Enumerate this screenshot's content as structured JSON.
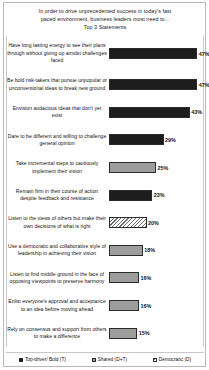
{
  "chart_data": {
    "type": "bar",
    "title": "In order to drive unprecedented success in today's fast paced environment, business leaders most need to... Top 3 Statements",
    "title_lines": [
      "In order to drive unprecedented success in today's fast",
      "paced environment, business leaders most need to...",
      "Top 3 Statements"
    ],
    "orientation": "horizontal",
    "xlabel": "",
    "ylabel": "",
    "xlim": [
      0,
      50
    ],
    "grid": false,
    "legend_position": "bottom",
    "categories": [
      "Have long lasting energy to see their plans through without giving up amidst challenges faced",
      "Be bold risk-takers  that pursue unpopular or unconventional ideas to break new ground",
      "Envision audacious ideas that don't yet exist",
      "Dare to be different and willing to challenge  general opinion",
      "Take incremental steps to cautiously implement their vision",
      "Remain firm in their course of action despite feedback and resistance",
      "Listen to the views of others but make their own decisions of what is right",
      "Use a democratic and collaborative style of leadership  in achieving their vision",
      "Listen to find middle ground in the face of opposing viewpoints  to preserve harmony",
      "Enlist everyone's approval and acceptance to an idea before moving ahead",
      "Rely on consensus and support from others to make a difference"
    ],
    "values": [
      47,
      47,
      43,
      29,
      25,
      23,
      20,
      18,
      16,
      16,
      15
    ],
    "value_labels": [
      "47%",
      "47%",
      "43%",
      "29%",
      "25%",
      "23%",
      "20%",
      "18%",
      "16%",
      "16%",
      "15%"
    ],
    "series_assignment": [
      "top-driver-bold",
      "top-driver-bold",
      "top-driver-bold",
      "top-driver-bold",
      "shared",
      "top-driver-bold",
      "democratic",
      "shared",
      "shared",
      "shared",
      "shared"
    ],
    "legend": [
      {
        "key": "top-driver-bold",
        "label": "Top-driver/ Bold (T)",
        "style": "solid-dark",
        "color": "#1d1d1d"
      },
      {
        "key": "shared",
        "label": "Shared (D+T)",
        "style": "solid-gray",
        "color": "#9d9d9d"
      },
      {
        "key": "democratic",
        "label": "Democratic (D)",
        "style": "hatched",
        "color": "#6d6d6d"
      }
    ]
  }
}
